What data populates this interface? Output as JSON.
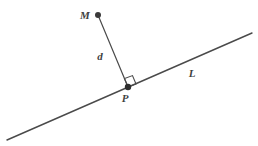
{
  "figure": {
    "background_color": "#ffffff",
    "stroke_color": "#4a4a4a",
    "label_color": "#3f3f3f",
    "width": 258,
    "height": 146
  },
  "labels": {
    "point_m": "M",
    "point_p": "P",
    "segment_d": "d",
    "line_l": "L"
  },
  "geometry": {
    "line_l": {
      "x1": 7,
      "y1": 140,
      "x2": 252,
      "y2": 33
    },
    "segment_d": {
      "x1": 98,
      "y1": 15,
      "x2": 128,
      "y2": 87
    },
    "point_m": {
      "cx": 98,
      "cy": 15,
      "r": 3
    },
    "point_p": {
      "cx": 128,
      "cy": 87,
      "r": 3.2
    },
    "right_angle_marker": {
      "points": "128,87 136,84 132.5,75.6 124.5,78.6"
    },
    "label_positions": {
      "point_m": {
        "x": 85,
        "y": 19
      },
      "point_p": {
        "x": 125,
        "y": 102
      },
      "segment_d": {
        "x": 100,
        "y": 60
      },
      "line_l": {
        "x": 192,
        "y": 77
      }
    }
  }
}
